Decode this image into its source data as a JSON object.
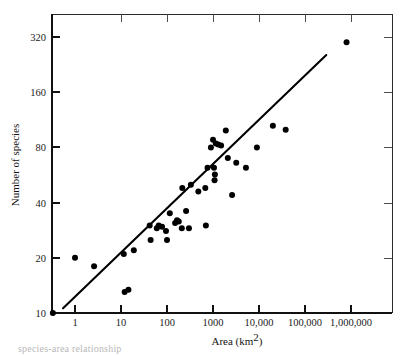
{
  "figure": {
    "name": "species-area-scatter-plot",
    "background_color": "#ffffff",
    "ink_color": "#000000",
    "caption_fragment": "species-area relationship"
  },
  "chart_data": {
    "type": "scatter",
    "title": "",
    "subtitle": "",
    "xlabel": "Area (km",
    "xlabel_sup": "2",
    "xlabel_tail": ")",
    "xlabel_full": "Area (km²)",
    "ylabel": "Number of species",
    "x_scale": "log",
    "y_scale": "log",
    "xlim": [
      0.3,
      3000000
    ],
    "ylim": [
      9.0,
      460
    ],
    "grid": false,
    "legend": null,
    "x_ticks": [
      {
        "value": 1,
        "label": "1"
      },
      {
        "value": 10,
        "label": "10"
      },
      {
        "value": 100,
        "label": "100"
      },
      {
        "value": 1000,
        "label": "1000"
      },
      {
        "value": 10000,
        "label": "10,000"
      },
      {
        "value": 100000,
        "label": "100,000"
      },
      {
        "value": 1000000,
        "label": "1,000,000"
      }
    ],
    "y_ticks": [
      {
        "value": 10,
        "label": "10"
      },
      {
        "value": 20,
        "label": "20"
      },
      {
        "value": 40,
        "label": "40"
      },
      {
        "value": 80,
        "label": "80"
      },
      {
        "value": 160,
        "label": "160"
      },
      {
        "value": 320,
        "label": "320"
      }
    ],
    "points": [
      {
        "x": 0.33,
        "y": 10
      },
      {
        "x": 1.0,
        "y": 20
      },
      {
        "x": 2.6,
        "y": 18
      },
      {
        "x": 12.0,
        "y": 13
      },
      {
        "x": 14.5,
        "y": 13.4
      },
      {
        "x": 11.5,
        "y": 21
      },
      {
        "x": 19.0,
        "y": 22
      },
      {
        "x": 42.0,
        "y": 30
      },
      {
        "x": 44.0,
        "y": 25
      },
      {
        "x": 60.0,
        "y": 29
      },
      {
        "x": 66.0,
        "y": 30
      },
      {
        "x": 78.0,
        "y": 29.5
      },
      {
        "x": 95.0,
        "y": 28
      },
      {
        "x": 100.0,
        "y": 25
      },
      {
        "x": 115.0,
        "y": 35
      },
      {
        "x": 150.0,
        "y": 31
      },
      {
        "x": 165.0,
        "y": 32
      },
      {
        "x": 180.0,
        "y": 31.5
      },
      {
        "x": 210.0,
        "y": 29
      },
      {
        "x": 260.0,
        "y": 36
      },
      {
        "x": 300.0,
        "y": 29
      },
      {
        "x": 215.0,
        "y": 48
      },
      {
        "x": 330.0,
        "y": 50
      },
      {
        "x": 480.0,
        "y": 46
      },
      {
        "x": 700.0,
        "y": 30
      },
      {
        "x": 680.0,
        "y": 48
      },
      {
        "x": 760.0,
        "y": 62
      },
      {
        "x": 900.0,
        "y": 80
      },
      {
        "x": 1000.0,
        "y": 88
      },
      {
        "x": 1150.0,
        "y": 84
      },
      {
        "x": 1300.0,
        "y": 83
      },
      {
        "x": 1500.0,
        "y": 82
      },
      {
        "x": 1050.0,
        "y": 62
      },
      {
        "x": 1100.0,
        "y": 57
      },
      {
        "x": 1080.0,
        "y": 53
      },
      {
        "x": 1900.0,
        "y": 99
      },
      {
        "x": 2100.0,
        "y": 70
      },
      {
        "x": 2600.0,
        "y": 44
      },
      {
        "x": 3200.0,
        "y": 66
      },
      {
        "x": 5200.0,
        "y": 62
      },
      {
        "x": 9000.0,
        "y": 80
      },
      {
        "x": 20000.0,
        "y": 105
      },
      {
        "x": 38000.0,
        "y": 100
      },
      {
        "x": 800000.0,
        "y": 300
      }
    ],
    "n_points": 44,
    "fit_line": {
      "label": "",
      "x_start": 0.55,
      "y_start": 10.6,
      "x_end": 290000.0,
      "y_end": 255.0
    }
  }
}
